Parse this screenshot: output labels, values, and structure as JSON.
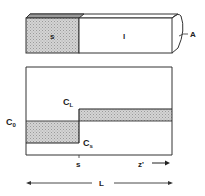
{
  "figure": {
    "type": "zone-melting concentration profile",
    "bar": {
      "solid_label": "s",
      "liquid_label": "l",
      "area_label": "A"
    },
    "plot": {
      "initial_conc_label": "C",
      "initial_conc_sub": "0",
      "liquid_conc_label": "C",
      "liquid_conc_sub": "L",
      "solid_conc_label": "C",
      "solid_conc_sub": "s",
      "interface_label": "s",
      "axis_label": "z'",
      "length_label": "L"
    },
    "colors": {
      "line": "#333333",
      "shade": "#c8c8c8",
      "background": "#ffffff"
    }
  }
}
